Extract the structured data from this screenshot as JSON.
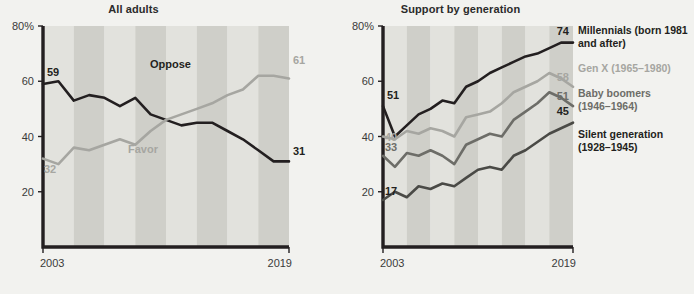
{
  "chart_data": [
    {
      "type": "line",
      "title": "All adults",
      "xlabel": "",
      "ylabel": "",
      "xlim": [
        2003,
        2019
      ],
      "ylim": [
        0,
        80
      ],
      "yticks": [
        "80%",
        "60",
        "40",
        "20"
      ],
      "ytick_values": [
        80,
        60,
        40,
        20
      ],
      "xticks": [
        "2003",
        "2019"
      ],
      "grid": false,
      "legend_position": "inline",
      "series": [
        {
          "name": "Oppose",
          "color": "#231f20",
          "start_label": "59",
          "end_label": "31",
          "inline_label": "Oppose",
          "x": [
            2003,
            2004,
            2005,
            2006,
            2007,
            2008,
            2009,
            2010,
            2011,
            2012,
            2013,
            2014,
            2015,
            2016,
            2017,
            2018,
            2019
          ],
          "values": [
            59,
            60,
            53,
            55,
            54,
            51,
            54,
            48,
            46,
            44,
            45,
            45,
            42,
            39,
            35,
            31,
            31
          ]
        },
        {
          "name": "Favor",
          "color": "#a6a6a1",
          "start_label": "32",
          "end_label": "61",
          "inline_label": "Favor",
          "x": [
            2003,
            2004,
            2005,
            2006,
            2007,
            2008,
            2009,
            2010,
            2011,
            2012,
            2013,
            2014,
            2015,
            2016,
            2017,
            2018,
            2019
          ],
          "values": [
            32,
            30,
            36,
            35,
            37,
            39,
            37,
            42,
            46,
            48,
            50,
            52,
            55,
            57,
            62,
            62,
            61
          ]
        }
      ]
    },
    {
      "type": "line",
      "title": "Support by generation",
      "xlabel": "",
      "ylabel": "",
      "xlim": [
        2003,
        2019
      ],
      "ylim": [
        0,
        80
      ],
      "yticks": [
        "80%",
        "60",
        "40",
        "20"
      ],
      "ytick_values": [
        80,
        60,
        40,
        20
      ],
      "xticks": [
        "2003",
        "2019"
      ],
      "grid": false,
      "legend_position": "right",
      "series": [
        {
          "name": "Millennials",
          "legend_label": "Millennials (born 1981 and after)",
          "color": "#231f20",
          "start_label": "51",
          "end_label": "74",
          "x": [
            2003,
            2004,
            2005,
            2006,
            2007,
            2008,
            2009,
            2010,
            2011,
            2012,
            2013,
            2014,
            2015,
            2016,
            2017,
            2018,
            2019
          ],
          "values": [
            51,
            40,
            44,
            48,
            50,
            53,
            52,
            58,
            60,
            63,
            65,
            67,
            69,
            70,
            72,
            74,
            74
          ]
        },
        {
          "name": "Gen X",
          "legend_label": "Gen X (1965–1980)",
          "color": "#a6a6a1",
          "start_label": "40",
          "end_label": "58",
          "x": [
            2003,
            2004,
            2005,
            2006,
            2007,
            2008,
            2009,
            2010,
            2011,
            2012,
            2013,
            2014,
            2015,
            2016,
            2017,
            2018,
            2019
          ],
          "values": [
            40,
            39,
            42,
            41,
            43,
            42,
            40,
            47,
            48,
            49,
            52,
            56,
            58,
            60,
            63,
            61,
            58
          ]
        },
        {
          "name": "Baby boomers",
          "legend_label": "Baby boomers (1946–1964)",
          "color": "#6d6d68",
          "start_label": "33",
          "end_label": "51",
          "x": [
            2003,
            2004,
            2005,
            2006,
            2007,
            2008,
            2009,
            2010,
            2011,
            2012,
            2013,
            2014,
            2015,
            2016,
            2017,
            2018,
            2019
          ],
          "values": [
            33,
            29,
            34,
            33,
            35,
            33,
            30,
            37,
            39,
            41,
            40,
            46,
            49,
            52,
            56,
            54,
            51
          ]
        },
        {
          "name": "Silent generation",
          "legend_label": "Silent generation (1928–1945)",
          "color": "#4a4a46",
          "start_label": "17",
          "end_label": "45",
          "x": [
            2003,
            2004,
            2005,
            2006,
            2007,
            2008,
            2009,
            2010,
            2011,
            2012,
            2013,
            2014,
            2015,
            2016,
            2017,
            2018,
            2019
          ],
          "values": [
            17,
            20,
            18,
            22,
            21,
            23,
            22,
            25,
            28,
            29,
            28,
            33,
            35,
            38,
            41,
            43,
            45
          ]
        }
      ]
    }
  ],
  "panels": {
    "left": {
      "title": "All adults",
      "yticks": [
        "80%",
        "60",
        "40",
        "20"
      ],
      "x_start": "2003",
      "x_end": "2019",
      "labels": {
        "oppose_start": "59",
        "oppose_end": "31",
        "oppose_name": "Oppose",
        "favor_start": "32",
        "favor_end": "61",
        "favor_name": "Favor"
      }
    },
    "right": {
      "title": "Support by generation",
      "yticks": [
        "80%",
        "60",
        "40",
        "20"
      ],
      "x_start": "2003",
      "x_end": "2019",
      "labels": {
        "mill_start": "51",
        "mill_end": "74",
        "genx_start": "40",
        "genx_end": "58",
        "boomer_start": "33",
        "boomer_end": "51",
        "silent_start": "17",
        "silent_end": "45"
      },
      "legend": {
        "millennials_l1": "Millennials (born 1981",
        "millennials_l2": "and after)",
        "genx_l1": "Gen X (1965–1980)",
        "boomers_l1": "Baby boomers",
        "boomers_l2": "(1946–1964)",
        "silent_l1": "Silent generation",
        "silent_l2": "(1928–1945)"
      }
    }
  },
  "colors": {
    "background": "#f2f2ef",
    "stripe_light": "#e2e2dd",
    "stripe_dark": "#cfcfc9",
    "axis": "#231f20",
    "dark_line": "#231f20",
    "gray_line": "#a6a6a1",
    "mid_line": "#6d6d68",
    "silent_line": "#4a4a46"
  }
}
